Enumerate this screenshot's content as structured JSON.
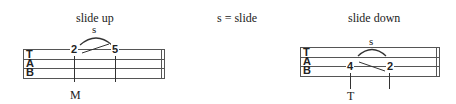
{
  "legend": "s = slide",
  "examples": [
    {
      "title": "slide up",
      "technique": "s",
      "from_fret": "2",
      "to_fret": "5",
      "clef": [
        "T",
        "A",
        "B"
      ],
      "finger": "M"
    },
    {
      "title": "slide down",
      "technique": "s",
      "from_fret": "4",
      "to_fret": "2",
      "clef": [
        "T",
        "A",
        "B"
      ],
      "finger": "T"
    }
  ]
}
